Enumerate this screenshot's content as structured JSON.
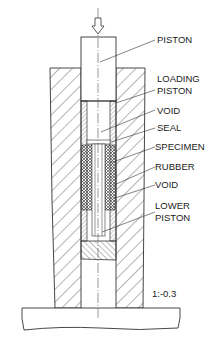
{
  "diagram": {
    "type": "cross-section",
    "labels": {
      "piston": "PISTON",
      "loading_piston_line1": "LOADING",
      "loading_piston_line2": "PISTON",
      "void_upper": "VOID",
      "seal": "SEAL",
      "specimen": "SPECIMEN",
      "rubber": "RUBBER",
      "void_lower": "VOID",
      "lower_piston_line1": "LOWER",
      "lower_piston_line2": "PISTON",
      "scale": "1:-0.3"
    },
    "icons": {
      "load_arrow": "down-arrow-icon"
    },
    "colors": {
      "stroke": "#333333",
      "background": "#ffffff"
    }
  }
}
